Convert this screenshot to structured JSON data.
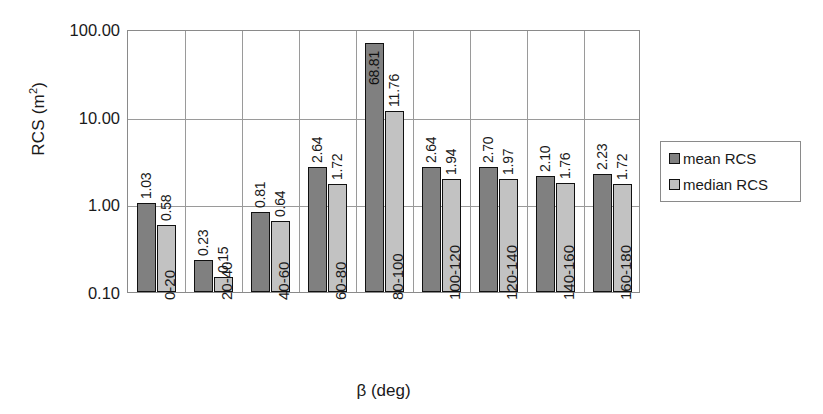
{
  "chart_data": {
    "type": "bar",
    "title": "",
    "xlabel": "β (deg)",
    "ylabel": "RCS (m²)",
    "ylabel_base": "RCS (m",
    "ylabel_sup": "2",
    "ylabel_tail": ")",
    "yscale": "log",
    "ylim": [
      0.1,
      100.0
    ],
    "grid": true,
    "legend_position": "right",
    "ytick_labels": [
      "100.00",
      "10.00",
      "1.00",
      "0.10"
    ],
    "ytick_values": [
      100.0,
      10.0,
      1.0,
      0.1
    ],
    "categories": [
      "0-20",
      "20-40",
      "40-60",
      "60-80",
      "80-100",
      "100-120",
      "120-140",
      "140-160",
      "160-180"
    ],
    "series": [
      {
        "name": "mean RCS",
        "color": "#808080",
        "values": [
          1.03,
          0.23,
          0.81,
          2.64,
          68.81,
          2.64,
          2.7,
          2.1,
          2.23
        ],
        "labels": [
          "1.03",
          "0.23",
          "0.81",
          "2.64",
          "68.81",
          "2.64",
          "2.70",
          "2.10",
          "2.23"
        ]
      },
      {
        "name": "median RCS",
        "color": "#c2c2c2",
        "values": [
          0.58,
          0.15,
          0.64,
          1.72,
          11.76,
          1.94,
          1.97,
          1.76,
          1.72
        ],
        "labels": [
          "0.58",
          "0.15",
          "0.64",
          "1.72",
          "11.76",
          "1.94",
          "1.97",
          "1.76",
          "1.72"
        ]
      }
    ]
  },
  "legend": {
    "items": [
      {
        "label": "mean RCS",
        "color": "#808080"
      },
      {
        "label": "median RCS",
        "color": "#c2c2c2"
      }
    ]
  }
}
